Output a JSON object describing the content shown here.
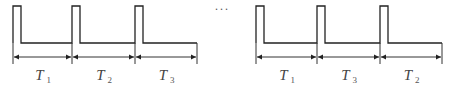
{
  "diagram": {
    "groups": [
      {
        "name": "left",
        "periods": [
          {
            "symbol": "T",
            "subscript": "1"
          },
          {
            "symbol": "T",
            "subscript": "2"
          },
          {
            "symbol": "T",
            "subscript": "3"
          }
        ]
      },
      {
        "name": "right",
        "periods": [
          {
            "symbol": "T",
            "subscript": "1"
          },
          {
            "symbol": "T",
            "subscript": "3"
          },
          {
            "symbol": "T",
            "subscript": "2"
          }
        ]
      }
    ],
    "ellipsis": "···",
    "colors": {
      "line": "#222222",
      "label": "#444444",
      "background": "#ffffff"
    }
  }
}
